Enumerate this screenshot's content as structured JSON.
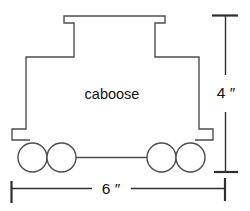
{
  "figure": {
    "shape": "caboose",
    "body_label": "caboose",
    "height_dimension": {
      "label": "4 ″",
      "value": 4,
      "unit": "inches"
    },
    "width_dimension": {
      "label": "6 ″",
      "value": 6,
      "unit": "inches"
    }
  },
  "colors": {
    "bg": "#ffffff",
    "line": "#4d4d4d",
    "dim": "#2e2e2e",
    "text": "#111111"
  }
}
